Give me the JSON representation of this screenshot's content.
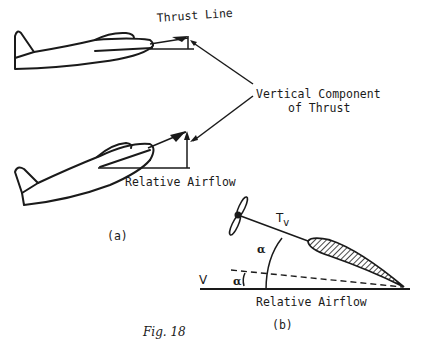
{
  "figure": {
    "caption": "Fig. 18",
    "panel_a": {
      "label": "(a)",
      "thrust_line_label": "Thrust Line",
      "vertical_component_label_line1": "Vertical Component",
      "vertical_component_label_line2": "of Thrust",
      "relative_airflow_label": "Relative Airflow"
    },
    "panel_b": {
      "label": "(b)",
      "thrust_vector_label": "T",
      "thrust_vector_subscript": "v",
      "alpha_upper": "α",
      "alpha_lower": "α",
      "velocity_label": "V",
      "relative_airflow_label": "Relative Airflow"
    }
  },
  "colors": {
    "ink": "#1a1a1a",
    "background": "#ffffff"
  }
}
